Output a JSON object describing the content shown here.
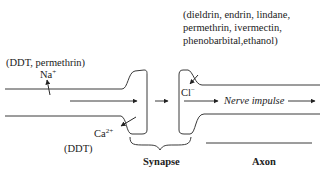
{
  "diagram": {
    "type": "nerve-synapse-ion-channel-targets",
    "labels": {
      "sodium_agents": "(DDT, permethrin)",
      "sodium_ion": "Na",
      "sodium_charge": "+",
      "chloride_agents_line1": "(dieldrin, endrin, lindane,",
      "chloride_agents_line2": "permethrin, ivermectin,",
      "chloride_agents_line3": "phenobarbital,ethanol)",
      "chloride_ion": "Cl",
      "chloride_charge": "−",
      "calcium_ion": "Ca",
      "calcium_charge": "2+",
      "calcium_agents": "(DDT)",
      "nerve_impulse": "Nerve impulse",
      "synapse": "Synapse",
      "axon": "Axon"
    },
    "colors": {
      "line": "#3a3a3a",
      "text": "#222222",
      "background": "#ffffff"
    }
  }
}
